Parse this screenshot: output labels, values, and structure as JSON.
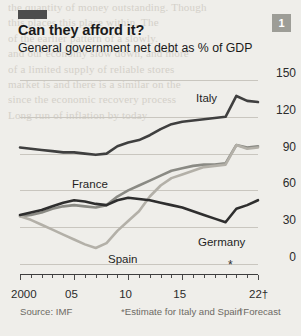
{
  "badge": {
    "number": "1"
  },
  "title": "Can they afford it?",
  "subtitle": "General government net debt as % of GDP",
  "footer": {
    "source": "Source: IMF",
    "estimate_note": "*Estimate for Italy and Spain",
    "forecast_note": "†Forecast"
  },
  "axis_markers": {
    "star": "*"
  },
  "ghost_text": [
    "",
    "",
    "",
    "",
    "",
    "the quantity of money outstanding. Though",
    "this places this place within. The",
    "of the earlier pattern of a slowly.",
    "and our economy slow down, and more",
    "of a limited supply of reliable stores",
    "market is and there is a similar on the",
    "since the economic recovery process",
    "",
    "",
    "",
    "Long run of inflation by today",
    "",
    "",
    ""
  ],
  "chart_data": {
    "type": "line",
    "title": "Can they afford it?",
    "subtitle": "General government net debt as % of GDP",
    "xlabel": "",
    "ylabel": "% of GDP",
    "xlim": [
      2000,
      2022
    ],
    "ylim": [
      0,
      150
    ],
    "yticks": [
      0,
      30,
      60,
      90,
      120,
      150
    ],
    "xticks": [
      2000,
      2005,
      2010,
      2015,
      2022
    ],
    "xtick_labels": [
      "2000",
      "05",
      "10",
      "15",
      "22†"
    ],
    "grid": "horizontal",
    "legend": "inline-labels",
    "x": [
      2000,
      2001,
      2002,
      2003,
      2004,
      2005,
      2006,
      2007,
      2008,
      2009,
      2010,
      2011,
      2012,
      2013,
      2014,
      2015,
      2016,
      2017,
      2018,
      2019,
      2020,
      2021,
      2022
    ],
    "series": [
      {
        "name": "Italy",
        "color": "#3f3f3f",
        "label_x": 196,
        "label_y": 92,
        "values": [
          95,
          94,
          93,
          92,
          91,
          91,
          90,
          89,
          90,
          96,
          99,
          101,
          105,
          110,
          114,
          116,
          117,
          118,
          119,
          120,
          137,
          133,
          132
        ]
      },
      {
        "name": "France",
        "color": "#8a8a84",
        "label_x": 72,
        "label_y": 178,
        "values": [
          39,
          40,
          42,
          45,
          47,
          48,
          47,
          46,
          48,
          55,
          60,
          64,
          68,
          72,
          76,
          78,
          80,
          81,
          81,
          82,
          97,
          95,
          96
        ]
      },
      {
        "name": "Spain",
        "color": "#b3b0a8",
        "label_x": 108,
        "label_y": 253,
        "values": [
          39,
          36,
          32,
          28,
          24,
          20,
          16,
          13,
          17,
          27,
          35,
          43,
          55,
          64,
          70,
          73,
          76,
          79,
          80,
          81,
          97,
          94,
          95
        ]
      },
      {
        "name": "Germany",
        "color": "#2e2e2e",
        "label_x": 198,
        "label_y": 236,
        "values": [
          40,
          42,
          44,
          47,
          50,
          52,
          51,
          49,
          48,
          52,
          54,
          53,
          52,
          50,
          48,
          46,
          43,
          40,
          37,
          34,
          45,
          48,
          52
        ]
      }
    ]
  }
}
